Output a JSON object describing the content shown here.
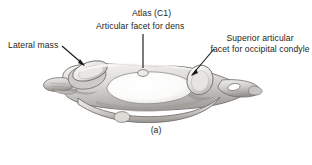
{
  "figure": {
    "caption": "(a)",
    "background_color": "#ffffff",
    "text_color": "#231f20",
    "leader_line_color": "#1a1a1a",
    "bone_colors": {
      "light": "#f2f1ef",
      "mid": "#d8d6d3",
      "shadow": "#a9a6a3",
      "deep_shadow": "#7d7a78",
      "outline": "#6e6b69"
    }
  },
  "labels": {
    "lateral_mass": "Lateral mass",
    "atlas": "Atlas (C1)",
    "articular_facet_for_dens": "Articular facet for dens",
    "superior_articular_line1": "Superior articular",
    "superior_articular_line2": "facet for occipital condyle"
  }
}
